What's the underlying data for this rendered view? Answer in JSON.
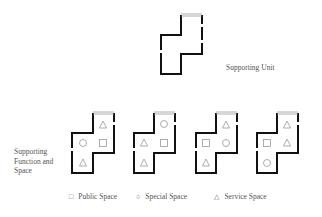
{
  "diagram": {
    "supporting_unit": {
      "label": "Supporting Unit",
      "outline": [
        [
          181,
          15
        ],
        [
          202,
          15
        ],
        [
          202,
          54
        ],
        [
          181,
          54
        ],
        [
          181,
          74
        ],
        [
          161,
          74
        ],
        [
          161,
          35
        ],
        [
          181,
          35
        ]
      ]
    },
    "supporting_function_label": "Supporting Function and Space",
    "units": [
      {
        "name": "variant-1",
        "offset_x": 72,
        "symbols": [
          {
            "type": "triangle",
            "cell": "top"
          },
          {
            "type": "circle",
            "cell": "mid-left"
          },
          {
            "type": "square",
            "cell": "mid-right"
          },
          {
            "type": "triangle",
            "cell": "bottom"
          }
        ]
      },
      {
        "name": "variant-2",
        "offset_x": 134,
        "symbols": [
          {
            "type": "circle",
            "cell": "top"
          },
          {
            "type": "triangle",
            "cell": "mid-left"
          },
          {
            "type": "square",
            "cell": "mid-right"
          },
          {
            "type": "triangle",
            "cell": "bottom"
          }
        ]
      },
      {
        "name": "variant-3",
        "offset_x": 196,
        "symbols": [
          {
            "type": "triangle",
            "cell": "top"
          },
          {
            "type": "square",
            "cell": "mid-left"
          },
          {
            "type": "circle",
            "cell": "mid-right"
          },
          {
            "type": "triangle",
            "cell": "bottom"
          }
        ]
      },
      {
        "name": "variant-4",
        "offset_x": 257,
        "symbols": [
          {
            "type": "triangle",
            "cell": "top"
          },
          {
            "type": "square",
            "cell": "mid-left"
          },
          {
            "type": "triangle",
            "cell": "mid-right"
          },
          {
            "type": "circle",
            "cell": "bottom"
          }
        ]
      }
    ],
    "legend": [
      {
        "symbol": "□",
        "label": "Public Space"
      },
      {
        "symbol": "○",
        "label": "Special Space"
      },
      {
        "symbol": "△",
        "label": "Service Space"
      }
    ],
    "colors": {
      "wall": "#111111",
      "window": "#aaaaaa",
      "symbol": "#999999",
      "text": "#555555"
    }
  }
}
